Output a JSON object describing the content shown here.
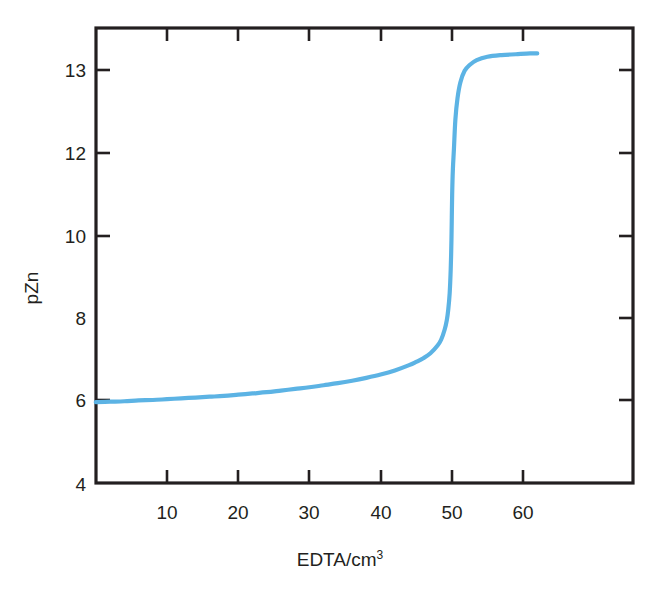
{
  "chart_data": {
    "type": "line",
    "title": "",
    "subtitle": "",
    "xlabel": "EDTA/cm3",
    "xlabel_base": "EDTA/cm",
    "xlabel_superscript": "3",
    "ylabel": "pZn",
    "xlim": [
      0,
      68
    ],
    "ylim_labels": [
      4,
      6,
      8,
      10,
      12,
      13
    ],
    "x_ticks": [
      10,
      20,
      30,
      40,
      50,
      60
    ],
    "x_tick_labels": [
      "10",
      "20",
      "30",
      "40",
      "50",
      "60"
    ],
    "y_ticks": [
      4,
      6,
      8,
      10,
      12,
      13
    ],
    "y_tick_labels": [
      "4",
      "6",
      "8",
      "10",
      "12",
      "13"
    ],
    "y_ticks_drawn_left": [
      6,
      10,
      12,
      13
    ],
    "grid": false,
    "legend": false,
    "legend_position": "none",
    "series": [
      {
        "name": "pZn titration curve",
        "color": "#5cb3e4",
        "x": [
          0.0,
          2.0,
          4.0,
          6.0,
          8.0,
          10.0,
          12.0,
          14.0,
          16.0,
          18.0,
          20.0,
          22.0,
          24.0,
          26.0,
          28.0,
          30.0,
          32.0,
          34.0,
          36.0,
          38.0,
          40.0,
          42.0,
          44.0,
          45.0,
          46.0,
          47.0,
          48.0,
          48.5,
          49.0,
          49.3,
          49.5,
          49.7,
          49.85,
          49.95,
          50.0,
          50.05,
          50.15,
          50.3,
          50.5,
          50.8,
          51.2,
          51.8,
          52.5,
          53.5,
          55.0,
          57.0,
          59.0,
          61.0,
          62.0
        ],
        "y": [
          5.95,
          5.96,
          5.97,
          5.99,
          6.0,
          6.02,
          6.04,
          6.06,
          6.08,
          6.1,
          6.13,
          6.16,
          6.19,
          6.23,
          6.27,
          6.31,
          6.36,
          6.41,
          6.47,
          6.54,
          6.62,
          6.72,
          6.85,
          6.93,
          7.02,
          7.14,
          7.33,
          7.47,
          7.72,
          7.95,
          8.2,
          8.6,
          9.2,
          9.9,
          10.45,
          11.0,
          11.6,
          12.05,
          12.4,
          12.66,
          12.85,
          12.99,
          13.06,
          13.12,
          13.16,
          13.18,
          13.19,
          13.2,
          13.2
        ]
      }
    ],
    "annotations": []
  },
  "axes": {
    "y_axis_label": "pZn",
    "x_axis_label_base": "EDTA/cm",
    "x_axis_label_sup": "3"
  },
  "ticks": {
    "x": [
      {
        "label": "10",
        "value": 10
      },
      {
        "label": "20",
        "value": 20
      },
      {
        "label": "30",
        "value": 30
      },
      {
        "label": "40",
        "value": 40
      },
      {
        "label": "50",
        "value": 50
      },
      {
        "label": "60",
        "value": 60
      }
    ],
    "y": [
      {
        "label": "13",
        "value": 13
      },
      {
        "label": "12",
        "value": 12
      },
      {
        "label": "10",
        "value": 10
      },
      {
        "label": "8",
        "value": 8
      },
      {
        "label": "6",
        "value": 6
      },
      {
        "label": "4",
        "value": 4
      }
    ]
  },
  "colors": {
    "curve": "#5cb3e4",
    "axis": "#231f20",
    "background": "#ffffff",
    "text": "#231f20"
  }
}
